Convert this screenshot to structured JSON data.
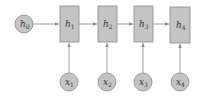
{
  "diagram": {
    "title": "",
    "initial_state": {
      "label": "h",
      "subscript": "0"
    },
    "hidden_states": [
      {
        "label": "h",
        "subscript": "1"
      },
      {
        "label": "h",
        "subscript": "2"
      },
      {
        "label": "h",
        "subscript": "3"
      },
      {
        "label": "h",
        "subscript": "4"
      }
    ],
    "inputs": [
      {
        "label": "x",
        "subscript": "1"
      },
      {
        "label": "x",
        "subscript": "2"
      },
      {
        "label": "x",
        "subscript": "3"
      },
      {
        "label": "x",
        "subscript": "4"
      }
    ],
    "colors": {
      "node_fill": "#c4c4c4",
      "node_stroke": "#8a8a8a",
      "edge": "#8a8a8a"
    }
  }
}
